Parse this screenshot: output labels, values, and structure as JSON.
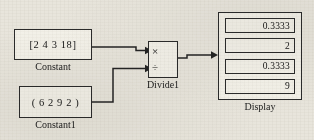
{
  "diagram": {
    "background_color": "#e8e5dc",
    "line_color": "#242424",
    "block_fill": "#f3f1e9"
  },
  "blocks": {
    "constant": {
      "name": "constant-block",
      "value_text": "[2  4  3  18]",
      "caption": "Constant"
    },
    "constant1": {
      "name": "constant1-block",
      "value_text": "( 6  2  9  2 )",
      "caption": "Constant1"
    },
    "divide": {
      "name": "divide-block",
      "caption": "Divide1",
      "operators": [
        {
          "symbol": "×",
          "icon": "multiply-icon",
          "port": "input-port-1"
        },
        {
          "symbol": "÷",
          "icon": "divide-icon",
          "port": "input-port-2"
        }
      ]
    },
    "display": {
      "name": "display-block",
      "caption": "Display",
      "values": [
        "0.3333",
        "2",
        "0.3333",
        "9"
      ]
    }
  },
  "signals": [
    {
      "name": "constant-to-divide-wire",
      "from": "constant",
      "to": "divide-input-1"
    },
    {
      "name": "constant1-to-divide-wire",
      "from": "constant1",
      "to": "divide-input-2"
    },
    {
      "name": "divide-to-display-wire",
      "from": "divide",
      "to": "display-input"
    }
  ]
}
